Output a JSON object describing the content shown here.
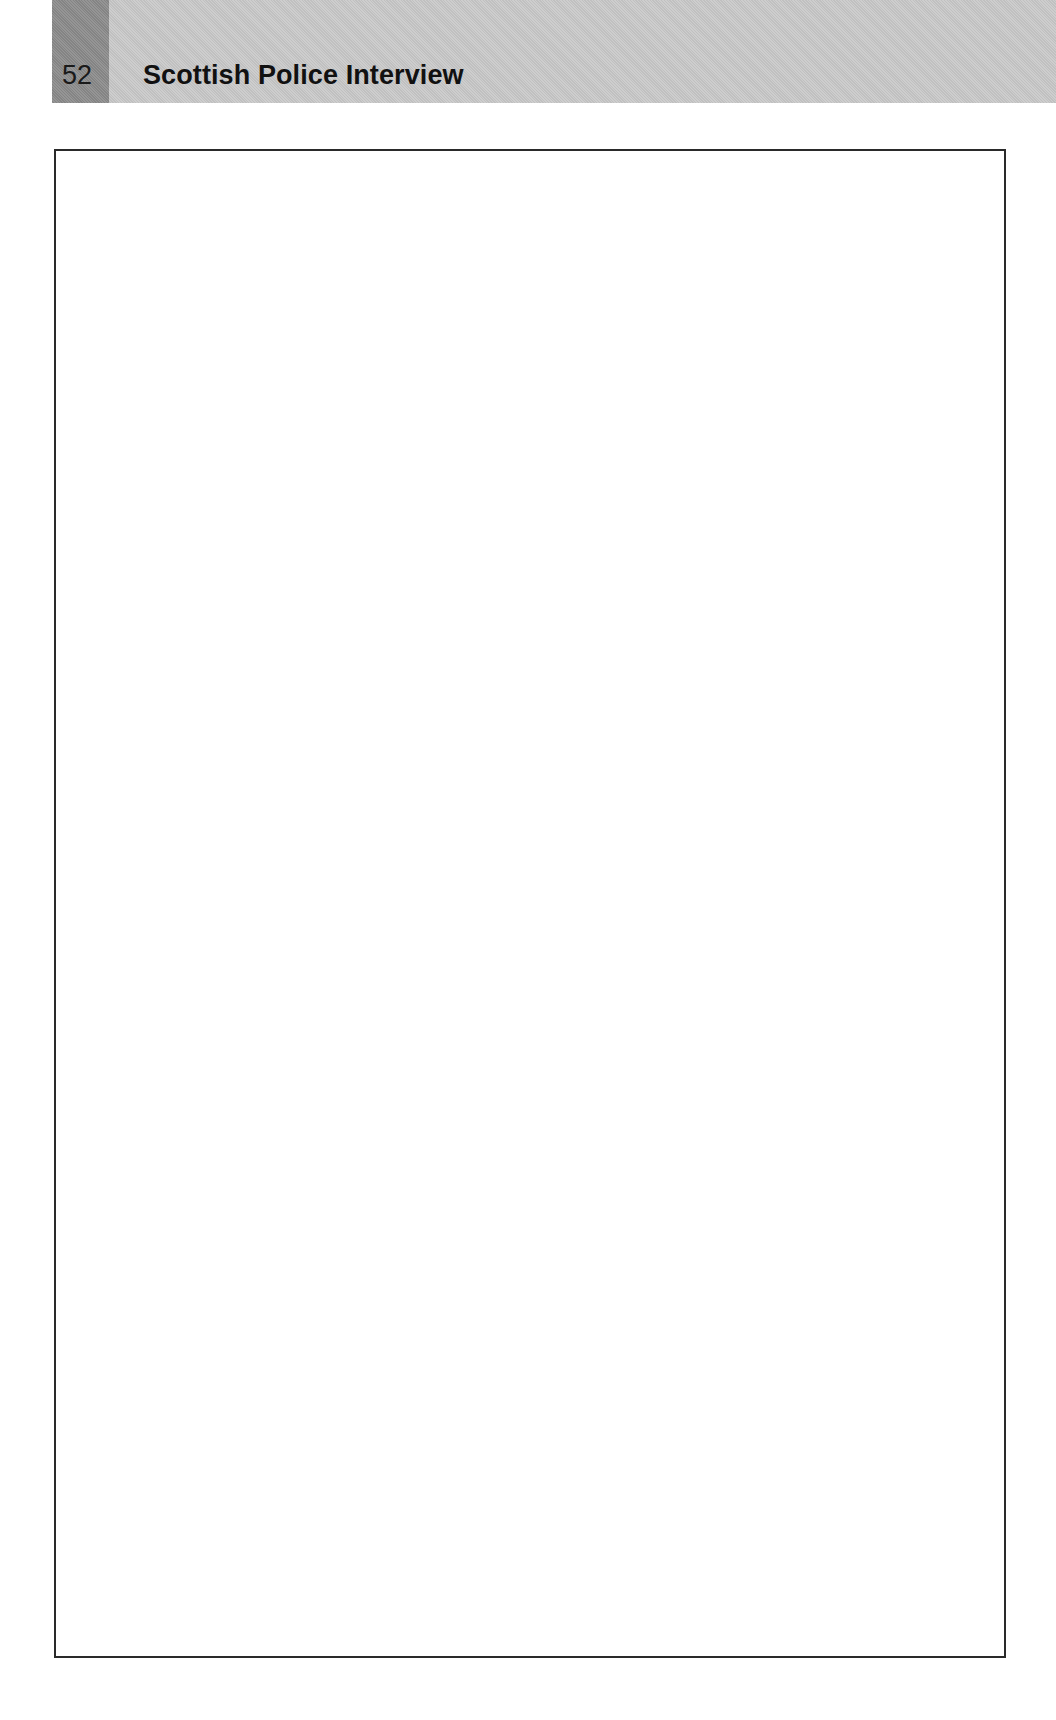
{
  "page": {
    "number": "52",
    "running_title": "Scottish Police Interview"
  },
  "colors": {
    "header_band": "#c8c8c8",
    "page_number_block": "#8c8c8c",
    "box_border": "#2a2a2a",
    "text": "#111111"
  },
  "content_box": {
    "type": "empty-framed-box"
  }
}
